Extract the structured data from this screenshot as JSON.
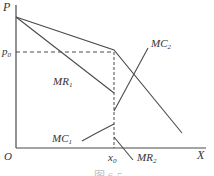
{
  "diagram": {
    "type": "kinked demand curve (economics)",
    "colors": {
      "line": "#4a4a4a",
      "text": "#333333",
      "background": "#ffffff"
    },
    "axes": {
      "y_label": "P",
      "x_label": "X",
      "origin_label": "O"
    },
    "price_level": {
      "label_main": "p",
      "label_sub": "0"
    },
    "quantity_level": {
      "label_main": "x",
      "label_sub": "0"
    },
    "curves": {
      "mr1": {
        "label_main": "MR",
        "label_sub": "1"
      },
      "mr2": {
        "label_main": "MR",
        "label_sub": "2"
      },
      "mc1": {
        "label_main": "MC",
        "label_sub": "1"
      },
      "mc2": {
        "label_main": "MC",
        "label_sub": "2"
      }
    },
    "caption": "图 6-5"
  }
}
